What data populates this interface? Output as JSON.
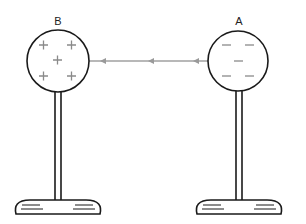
{
  "diagram": {
    "spheres": [
      {
        "label": "B",
        "charge": "positive",
        "symbol": "+",
        "count": 5
      },
      {
        "label": "A",
        "charge": "negative",
        "symbol": "−",
        "count": 5
      }
    ],
    "field_line": {
      "direction": "from A to B (leftward)",
      "arrowheads": 3
    },
    "colors": {
      "outline": "#1a1a1a",
      "charge": "#8a8a8a",
      "field_line": "#9a9a9a"
    }
  }
}
